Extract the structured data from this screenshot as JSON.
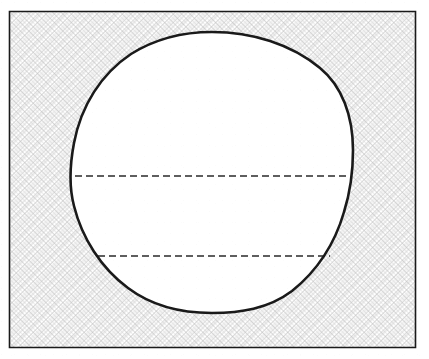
{
  "figure": {
    "background_color": "#ffffff",
    "line_color": "#1a1a1a",
    "hatch_color": "#9a9a9a",
    "fill_color": "#ffffff"
  },
  "frame": {
    "name": "outer-rectangle",
    "x": 9,
    "y": 11,
    "width": 407,
    "height": 337,
    "stroke_width": 1.6,
    "hatched": true
  },
  "circle": {
    "name": "circular-region",
    "center_x": 212,
    "center_y": 172,
    "radius_x": 140,
    "radius_y": 140,
    "left_x": 72,
    "right_x": 352,
    "top_y": 33,
    "bottom_y": 312,
    "stroke_width": 2.6,
    "fill": "#ffffff"
  },
  "chords": [
    {
      "name": "upper-dashed-chord",
      "y": 176,
      "x_start": 75,
      "x_end": 350,
      "dash": "7 4",
      "stroke_width": 1.5
    },
    {
      "name": "lower-dashed-chord",
      "y": 256,
      "x_start": 98,
      "x_end": 330,
      "dash": "7 4",
      "stroke_width": 1.5
    }
  ],
  "hatch_pattern": {
    "name": "diagonal-cross-hatch",
    "spacing": 6,
    "angle_degrees": 45,
    "stroke_width": 0.7
  },
  "labels": []
}
